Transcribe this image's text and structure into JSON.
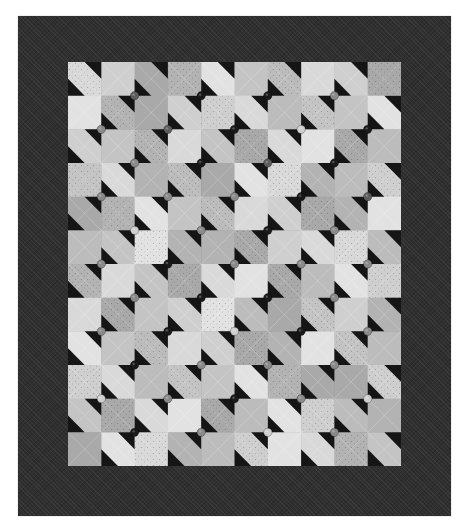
{
  "image": {
    "subject": "Black-and-white photograph of a patchwork quilt",
    "description": "Pieced center of light squares with dark half-square triangles forming a repeating bowtie/pinwheel pattern, decorated with buttons at block corners, framed by a wide dark border"
  },
  "quilt": {
    "border_color": "#2f2f2f",
    "field": {
      "columns": 10,
      "rows": 12
    },
    "triangle_color": "#151515",
    "patch_tones": [
      "#d9d9d9",
      "#c4c4c4",
      "#b3b3b3",
      "#cfcfcf",
      "#bcbcbc",
      "#e2e2e2",
      "#a9a9a9"
    ],
    "button_tones": {
      "dark": "#1a1a1a",
      "medium": "#5e5e5e",
      "light": "#cfcfcf",
      "gray": "#8a8a8a"
    },
    "buttons": [
      "r1:medium,dark,dark,gray",
      "r2:gray,medium,dark,light,dark",
      "r3:gray,dark,medium,dark",
      "r4:gray,gray,gray,dark,medium",
      "r5:light,gray,dark,gray",
      "r6:gray,dark,gray,gray,gray",
      "r7:gray,dark,dark,gray",
      "r8:gray,dark,light,dark,gray",
      "r9:dark,gray,gray,gray",
      "r10:light,gray,dark,gray,light",
      "r11:dark,gray,light,gray"
    ]
  }
}
